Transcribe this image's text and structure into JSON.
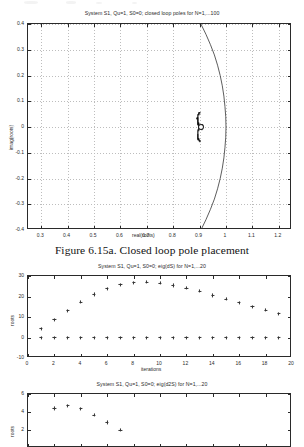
{
  "document": {
    "caption": "Figure 6.15a. Closed loop pole placement"
  },
  "chart_data": [
    {
      "id": "closed-loop-poles",
      "type": "scatter",
      "title": "System S1, Qu=1, S0=0; closed loop poles for N=1,...100",
      "xlabel": "real(roots)",
      "ylabel": "imag(roots)",
      "xlim": [
        0.25,
        1.25
      ],
      "ylim": [
        -0.4,
        0.4
      ],
      "xticks": [
        0.3,
        0.4,
        0.5,
        0.6,
        0.7,
        0.8,
        0.9,
        1,
        1.1,
        1.2
      ],
      "xticklabels": [
        "0.3",
        "0.4",
        "0.5",
        "0.6",
        "0.7",
        "0.8",
        "0.9",
        "1",
        "1.1",
        "1.2"
      ],
      "yticks": [
        0.4,
        0.3,
        0.2,
        0.1,
        0,
        -0.1,
        -0.2,
        -0.3,
        -0.4
      ],
      "yticklabels": [
        "0.4",
        "0.3",
        "0.2",
        "0.1",
        "0",
        "-0.1",
        "-0.2",
        "-0.3",
        "-0.4"
      ],
      "grid": true,
      "series": [
        {
          "name": "unit-circle-arc",
          "kind": "line",
          "comment": "arc bulging right, crosses real axis near 1.0, exits plot top/bottom near 0.90",
          "points": [
            [
              0.905,
              0.4
            ],
            [
              0.924,
              0.36
            ],
            [
              0.941,
              0.32
            ],
            [
              0.956,
              0.28
            ],
            [
              0.968,
              0.24
            ],
            [
              0.978,
              0.2
            ],
            [
              0.986,
              0.16
            ],
            [
              0.992,
              0.12
            ],
            [
              0.996,
              0.08
            ],
            [
              0.999,
              0.04
            ],
            [
              1.0,
              0.0
            ],
            [
              0.999,
              -0.04
            ],
            [
              0.996,
              -0.08
            ],
            [
              0.992,
              -0.12
            ],
            [
              0.986,
              -0.16
            ],
            [
              0.978,
              -0.2
            ],
            [
              0.968,
              -0.24
            ],
            [
              0.956,
              -0.28
            ],
            [
              0.941,
              -0.32
            ],
            [
              0.924,
              -0.36
            ],
            [
              0.905,
              -0.4
            ]
          ]
        },
        {
          "name": "closed-loop-poles-cluster",
          "kind": "scatter",
          "comment": "dense crescent cluster centred near (0.90, 0) spanning about +/-0.055 imag",
          "points": [
            [
              0.9015,
              0.0
            ],
            [
              0.9005,
              0.0
            ],
            [
              0.8995,
              0.0
            ],
            [
              0.8985,
              0.0
            ],
            [
              0.8975,
              0.0
            ],
            [
              0.8965,
              0.004
            ],
            [
              0.897,
              -0.004
            ],
            [
              0.8955,
              0.008
            ],
            [
              0.896,
              -0.008
            ],
            [
              0.8945,
              0.012
            ],
            [
              0.895,
              -0.012
            ],
            [
              0.8938,
              0.016
            ],
            [
              0.8942,
              -0.016
            ],
            [
              0.893,
              0.02
            ],
            [
              0.8935,
              -0.02
            ],
            [
              0.8925,
              0.024
            ],
            [
              0.893,
              -0.024
            ],
            [
              0.8922,
              0.028
            ],
            [
              0.8928,
              -0.028
            ],
            [
              0.892,
              0.032
            ],
            [
              0.8926,
              -0.032
            ],
            [
              0.8922,
              0.036
            ],
            [
              0.8928,
              -0.036
            ],
            [
              0.8928,
              0.04
            ],
            [
              0.8934,
              -0.04
            ],
            [
              0.8938,
              0.044
            ],
            [
              0.8944,
              -0.044
            ],
            [
              0.8952,
              0.048
            ],
            [
              0.8958,
              -0.048
            ],
            [
              0.897,
              0.051
            ],
            [
              0.8976,
              -0.051
            ],
            [
              0.8992,
              0.054
            ],
            [
              0.8998,
              -0.054
            ],
            [
              0.9012,
              0.0555
            ],
            [
              0.9018,
              -0.0555
            ],
            [
              0.8978,
              0.002
            ],
            [
              0.8982,
              -0.002
            ],
            [
              0.8968,
              0.006
            ],
            [
              0.8972,
              -0.006
            ],
            [
              0.8958,
              0.01
            ],
            [
              0.8962,
              -0.01
            ],
            [
              0.895,
              0.014
            ],
            [
              0.8954,
              -0.014
            ],
            [
              0.8941,
              0.018
            ],
            [
              0.8946,
              -0.018
            ],
            [
              0.8932,
              0.022
            ],
            [
              0.8937,
              -0.022
            ],
            [
              0.8926,
              0.026
            ],
            [
              0.8931,
              -0.026
            ],
            [
              0.8921,
              0.03
            ],
            [
              0.8926,
              -0.03
            ],
            [
              0.8919,
              0.034
            ],
            [
              0.8924,
              -0.034
            ],
            [
              0.8922,
              0.038
            ],
            [
              0.8928,
              -0.038
            ],
            [
              0.893,
              0.042
            ],
            [
              0.8936,
              -0.042
            ],
            [
              0.8945,
              0.046
            ],
            [
              0.8951,
              -0.046
            ],
            [
              0.8962,
              0.0495
            ],
            [
              0.8968,
              -0.0495
            ],
            [
              0.8984,
              0.0528
            ],
            [
              0.899,
              -0.0528
            ],
            [
              0.9006,
              0.0548
            ],
            [
              0.9012,
              -0.0548
            ],
            [
              0.9025,
              0.0
            ],
            [
              0.9035,
              0.0
            ],
            [
              0.9045,
              0.0
            ],
            [
              0.9055,
              0.0
            ],
            [
              0.9065,
              0.003
            ],
            [
              0.9065,
              -0.003
            ],
            [
              0.9075,
              0.005
            ],
            [
              0.9075,
              -0.005
            ],
            [
              0.9085,
              0.007
            ],
            [
              0.9085,
              -0.007
            ],
            [
              0.9095,
              0.009
            ],
            [
              0.9095,
              -0.009
            ],
            [
              0.9105,
              0.006
            ],
            [
              0.9105,
              -0.006
            ],
            [
              0.9112,
              0.003
            ],
            [
              0.9112,
              -0.003
            ],
            [
              0.9118,
              0.0
            ],
            [
              0.8998,
              0.003
            ],
            [
              0.8998,
              -0.003
            ],
            [
              0.8988,
              0.005
            ],
            [
              0.8988,
              -0.005
            ]
          ]
        },
        {
          "name": "open-circle-marker",
          "kind": "circle-marker",
          "points": [
            [
              0.9035,
              0.0
            ]
          ]
        }
      ]
    },
    {
      "id": "eig-dS",
      "type": "scatter",
      "title": "System S1, Qu=1, S0=0; eig(dS) for N=1,...20",
      "xlabel": "iterations",
      "ylabel": "roots",
      "xlim": [
        0,
        20
      ],
      "ylim": [
        -10,
        30
      ],
      "xticks": [
        0,
        2,
        4,
        6,
        8,
        10,
        12,
        14,
        16,
        18,
        20
      ],
      "xticklabels": [
        "0",
        "2",
        "4",
        "6",
        "8",
        "10",
        "12",
        "14",
        "16",
        "18",
        "20"
      ],
      "yticks": [
        30,
        20,
        10,
        0,
        -10
      ],
      "yticklabels": [
        "30",
        "20",
        "10",
        "0",
        "-10"
      ],
      "grid": false,
      "x": [
        1,
        2,
        3,
        4,
        5,
        6,
        7,
        8,
        9,
        10,
        11,
        12,
        13,
        14,
        15,
        16,
        17,
        18,
        19,
        20
      ],
      "series": [
        {
          "name": "eig-dS-upper",
          "kind": "scatter",
          "values": [
            4.2,
            8.6,
            13.0,
            17.2,
            21.0,
            23.8,
            25.8,
            26.8,
            27.0,
            26.6,
            25.4,
            24.0,
            22.6,
            20.5,
            18.7,
            16.9,
            15.0,
            13.4,
            11.7,
            10.0
          ]
        },
        {
          "name": "eig-dS-zero",
          "kind": "scatter",
          "values": [
            0,
            0,
            0,
            0,
            0,
            0,
            0,
            0,
            0,
            0,
            0,
            0,
            0,
            0,
            0,
            0,
            0,
            0,
            0,
            0
          ]
        }
      ]
    },
    {
      "id": "eig-d2S",
      "type": "scatter",
      "title": "System S1, Qu=1, S0=0; eig(d2S) for N=1,...20",
      "xlabel": "iterations",
      "ylabel": "roots",
      "xlim": [
        0,
        20
      ],
      "ylim": [
        0,
        6
      ],
      "xticks": [
        0,
        2,
        4,
        6,
        8,
        10,
        12,
        14,
        16,
        18,
        20
      ],
      "xticklabels": [
        "0",
        "2",
        "4",
        "6",
        "8",
        "10",
        "12",
        "14",
        "16",
        "18",
        "20"
      ],
      "yticks": [
        6,
        4,
        2
      ],
      "yticklabels": [
        "6",
        "4",
        "2"
      ],
      "grid": false,
      "x": [
        2,
        3,
        4,
        5,
        6,
        7
      ],
      "series": [
        {
          "name": "eig-d2S",
          "kind": "scatter",
          "values": [
            4.4,
            4.7,
            4.35,
            3.65,
            2.85,
            2.0
          ]
        }
      ]
    }
  ]
}
